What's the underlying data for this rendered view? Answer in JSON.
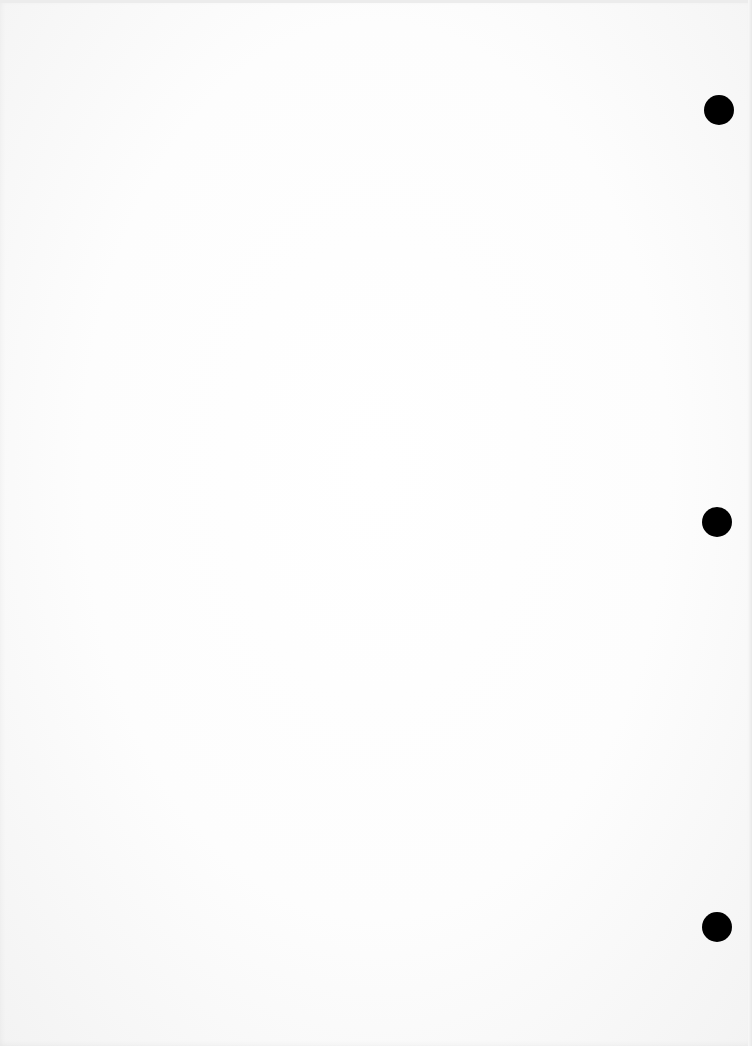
{
  "document": {
    "type": "blank scanned page",
    "text": "",
    "background_color": "#fdfdfd",
    "binder_holes": [
      {
        "cx": 719,
        "cy": 110,
        "diameter": 30,
        "color": "#000000"
      },
      {
        "cx": 717,
        "cy": 522,
        "diameter": 30,
        "color": "#000000"
      },
      {
        "cx": 717,
        "cy": 927,
        "diameter": 30,
        "color": "#000000"
      }
    ]
  }
}
